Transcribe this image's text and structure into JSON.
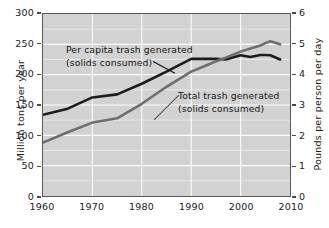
{
  "chart_data": {
    "type": "line",
    "title": "",
    "xlabel": "",
    "ylabel": "Million tons per year",
    "ylabel_right": "Pounds per person per day",
    "xlim": [
      1960,
      2010
    ],
    "ylim": [
      0,
      300
    ],
    "ylim_right": [
      0,
      6
    ],
    "grid": true,
    "legend_position": "inline-annotations",
    "x_ticks": [
      "1960",
      "1970",
      "1980",
      "1990",
      "2000",
      "2010"
    ],
    "x_tick_values": [
      1960,
      1970,
      1980,
      1990,
      2000,
      2010
    ],
    "y_ticks_left": [
      "0",
      "50",
      "100",
      "150",
      "200",
      "250",
      "300"
    ],
    "y_tick_values_left": [
      0,
      50,
      100,
      150,
      200,
      250,
      300
    ],
    "y_ticks_right": [
      "0",
      "1",
      "2",
      "3",
      "4",
      "5",
      "6"
    ],
    "y_tick_values_right": [
      0,
      1,
      2,
      3,
      4,
      5,
      6
    ],
    "minor_gridline_step_left": 25,
    "annotations": [
      {
        "name": "per-capita-label",
        "line1": "Per capita trash generated",
        "line2": "(solids consumed)"
      },
      {
        "name": "total-label",
        "line1": "Total trash generated",
        "line2": "(solids consumed)"
      }
    ],
    "series": [
      {
        "name": "Per capita trash generated (solids consumed)",
        "axis": "right",
        "unit": "Pounds per person per day",
        "color": "#1c1c1c",
        "x": [
          1960,
          1965,
          1970,
          1975,
          1980,
          1985,
          1990,
          1993,
          1995,
          1997,
          2000,
          2002,
          2004,
          2005,
          2006,
          2008
        ],
        "values": [
          2.68,
          2.88,
          3.25,
          3.35,
          3.7,
          4.1,
          4.52,
          4.52,
          4.52,
          4.5,
          4.64,
          4.58,
          4.65,
          4.65,
          4.64,
          4.5
        ]
      },
      {
        "name": "Total trash generated (solids consumed)",
        "axis": "left",
        "unit": "Million tons per year",
        "color": "#6e6e6e",
        "x": [
          1960,
          1965,
          1970,
          1975,
          1980,
          1985,
          1990,
          1993,
          1995,
          1997,
          2000,
          2002,
          2004,
          2005,
          2006,
          2008
        ],
        "values": [
          88,
          105,
          121,
          128,
          152,
          180,
          205,
          215,
          222,
          228,
          238,
          243,
          248,
          252,
          255,
          250
        ]
      }
    ]
  },
  "axes": {
    "left_title": "Million tons per year",
    "right_title": "Pounds per person per day"
  }
}
